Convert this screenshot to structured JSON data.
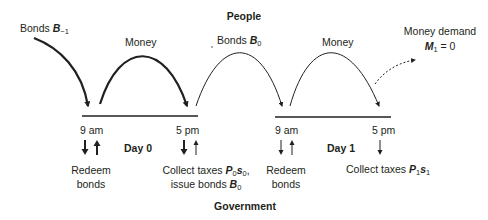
{
  "title_top": "People",
  "title_bottom": "Government",
  "flows": {
    "bonds_prev": {
      "label": "Bonds",
      "var": "B",
      "sub": "−1"
    },
    "money_day0": {
      "label": "Money"
    },
    "bonds_day0": {
      "label": "Bonds",
      "var": "B",
      "sub": "0"
    },
    "money_day1": {
      "label": "Money"
    },
    "money_demand": {
      "label": "Money demand",
      "var": "M",
      "sub": "1",
      "eq": "= 0"
    }
  },
  "days": [
    {
      "label": "Day 0",
      "morning": {
        "time": "9 am",
        "event_line1": "Redeem",
        "event_line2": "bonds"
      },
      "evening": {
        "time": "5 pm",
        "event_line1_prefix": "Collect taxes",
        "event_var1": "P",
        "event_sub1": "0",
        "event_var2": "s",
        "event_sub2": "0",
        "event_line1_suffix": ",",
        "event_line2_prefix": "issue bonds",
        "event_line2_var": "B",
        "event_line2_sub": "0"
      }
    },
    {
      "label": "Day 1",
      "morning": {
        "time": "9 am",
        "event_line1": "Redeem",
        "event_line2": "bonds"
      },
      "evening": {
        "time": "5 pm",
        "event_line1_prefix": "Collect taxes",
        "event_var1": "P",
        "event_sub1": "1",
        "event_var2": "s",
        "event_sub2": "1"
      }
    }
  ],
  "colors": {
    "ink": "#231f20",
    "background": "#ffffff"
  }
}
